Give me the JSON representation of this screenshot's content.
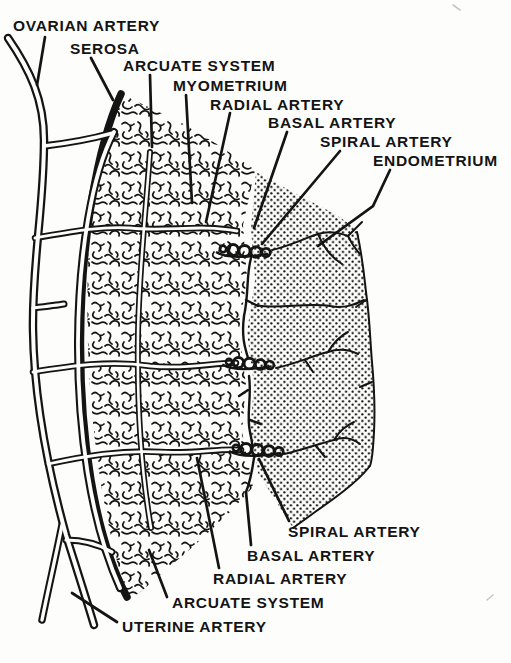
{
  "figure": {
    "type": "anatomical-line-diagram",
    "subject_labels_top": [
      "OVARIAN ARTERY",
      "SEROSA",
      "ARCUATE SYSTEM",
      "MYOMETRIUM",
      "RADIAL ARTERY",
      "BASAL ARTERY",
      "SPIRAL ARTERY",
      "ENDOMETRIUM"
    ],
    "subject_labels_bottom": [
      "SPIRAL ARTERY",
      "BASAL ARTERY",
      "RADIAL ARTERY",
      "ARCUATE SYSTEM",
      "UTERINE ARTERY"
    ]
  },
  "labels": {
    "ovarian_artery": "OVARIAN ARTERY",
    "serosa": "SEROSA",
    "arcuate_system_top": "ARCUATE SYSTEM",
    "myometrium": "MYOMETRIUM",
    "radial_artery_top": "RADIAL ARTERY",
    "basal_artery_top": "BASAL ARTERY",
    "spiral_artery_top": "SPIRAL ARTERY",
    "endometrium": "ENDOMETRIUM",
    "spiral_artery_bottom": "SPIRAL ARTERY",
    "basal_artery_bottom": "BASAL ARTERY",
    "radial_artery_bottom": "RADIAL ARTERY",
    "arcuate_system_bottom": "ARCUATE SYSTEM",
    "uterine_artery": "UTERINE ARTERY"
  },
  "colors": {
    "ink": "#141414",
    "paper": "#fdfdfc"
  }
}
